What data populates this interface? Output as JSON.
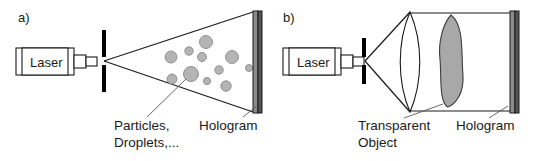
{
  "figure": {
    "background_color": "#ffffff",
    "ink_color": "#1a1a1a",
    "width": 533,
    "height": 161
  },
  "panels": [
    {
      "id": "a",
      "label": "a)",
      "label_pos": {
        "x": 18,
        "y": 22
      },
      "description": "Diverging laser beam illuminates a cloud of particles/droplets; hologram recorded on plate",
      "source": {
        "name": "laser-source",
        "label": "Laser",
        "label_pos": {
          "x": 30,
          "y": 67
        },
        "body": {
          "x": 16,
          "y": 48,
          "w": 58,
          "h": 27
        },
        "inner": {
          "x": 22,
          "y": 48,
          "w": 46,
          "h": 27
        },
        "neck": {
          "x": 74,
          "y": 55,
          "w": 12,
          "h": 13
        },
        "collimator": {
          "x": 86,
          "y": 57,
          "w": 11,
          "h": 9
        }
      },
      "aperture": {
        "name": "pinhole-aperture",
        "x": 102,
        "top_y": 30,
        "bot_y": 92,
        "gap_half": 4,
        "width": 4,
        "color": "#000000"
      },
      "beam": {
        "apex": {
          "x": 104,
          "y": 61
        },
        "top_end": {
          "x": 253,
          "y": 12
        },
        "bot_end": {
          "x": 253,
          "y": 112
        }
      },
      "plate": {
        "name": "hologram-plate",
        "x": 253,
        "y": 11,
        "w": 9,
        "h": 102,
        "face_color": "#8c8c8c",
        "edge_color": "#545454"
      },
      "particles": [
        {
          "cx": 206,
          "cy": 42,
          "r": 6.5
        },
        {
          "cx": 232,
          "cy": 57,
          "r": 6.5
        },
        {
          "cx": 171,
          "cy": 57,
          "r": 6.0
        },
        {
          "cx": 189,
          "cy": 51,
          "r": 4.2
        },
        {
          "cx": 202,
          "cy": 57,
          "r": 4.5
        },
        {
          "cx": 219,
          "cy": 70,
          "r": 4.2
        },
        {
          "cx": 191,
          "cy": 74,
          "r": 7.5
        },
        {
          "cx": 172,
          "cy": 79,
          "r": 5.0
        },
        {
          "cx": 207,
          "cy": 81,
          "r": 3.6
        },
        {
          "cx": 226,
          "cy": 86,
          "r": 5.2
        },
        {
          "cx": 249,
          "cy": 68,
          "r": 3.5
        }
      ],
      "callouts": [
        {
          "name": "particles-callout",
          "lines": [
            "Particles,",
            "Droplets,..."
          ],
          "text_pos": {
            "x": 114,
            "y": 130
          },
          "line_height": 17,
          "leader": {
            "x1": 147,
            "y1": 117,
            "x2": 186,
            "y2": 79
          }
        },
        {
          "name": "hologram-callout",
          "lines": [
            "Hologram"
          ],
          "text_pos": {
            "x": 199,
            "y": 130
          },
          "line_height": 17,
          "leader": {
            "x1": 243,
            "y1": 117,
            "x2": 258,
            "y2": 105
          }
        }
      ]
    },
    {
      "id": "b",
      "label": "b)",
      "label_pos": {
        "x": 283,
        "y": 22
      },
      "description": "Laser beam expanded and collimated by a lens through a transparent object onto the hologram plate",
      "source": {
        "name": "laser-source",
        "label": "Laser",
        "label_pos": {
          "x": 297,
          "y": 67
        },
        "body": {
          "x": 283,
          "y": 48,
          "w": 58,
          "h": 27
        },
        "inner": {
          "x": 289,
          "y": 48,
          "w": 46,
          "h": 27
        },
        "neck": {
          "x": 341,
          "y": 55,
          "w": 12,
          "h": 13
        },
        "collimator": {
          "x": 353,
          "y": 57,
          "w": 11,
          "h": 9
        }
      },
      "aperture": {
        "name": "pinhole-aperture",
        "x": 362,
        "top_y": 38,
        "bot_y": 84,
        "gap_half": 4,
        "width": 4,
        "color": "#000000"
      },
      "beam": {
        "apex": {
          "x": 365,
          "y": 61
        },
        "top_end": {
          "x": 410,
          "y": 12
        },
        "bot_end": {
          "x": 410,
          "y": 112
        }
      },
      "lens": {
        "name": "collimating-lens",
        "cx": 410,
        "top_y": 12,
        "bot_y": 112,
        "bulge": 13
      },
      "rails": {
        "top": {
          "x1": 410,
          "y1": 13,
          "x2": 510,
          "y2": 13
        },
        "bottom": {
          "x1": 410,
          "y1": 111,
          "x2": 510,
          "y2": 111
        }
      },
      "object": {
        "name": "transparent-object",
        "cx": 451,
        "cy": 61,
        "rx": 13,
        "ry": 46,
        "fill": "#a8a8a8"
      },
      "plate": {
        "name": "hologram-plate",
        "x": 510,
        "y": 11,
        "w": 9,
        "h": 102,
        "face_color": "#8c8c8c",
        "edge_color": "#545454"
      },
      "callouts": [
        {
          "name": "transparent-object-callout",
          "lines": [
            "Transparent",
            "Object"
          ],
          "text_pos": {
            "x": 358,
            "y": 130
          },
          "line_height": 17,
          "leader": {
            "x1": 404,
            "y1": 118,
            "x2": 443,
            "y2": 104
          }
        },
        {
          "name": "hologram-callout",
          "lines": [
            "Hologram"
          ],
          "text_pos": {
            "x": 456,
            "y": 130
          },
          "line_height": 17,
          "leader": {
            "x1": 489,
            "y1": 118,
            "x2": 508,
            "y2": 106
          }
        }
      ]
    }
  ]
}
